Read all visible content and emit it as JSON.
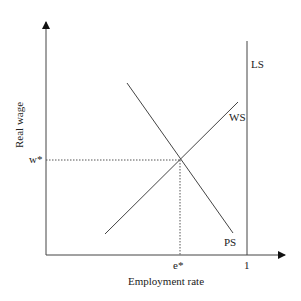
{
  "diagram": {
    "type": "economics-wage-setting-price-setting",
    "axes": {
      "x_label": "Employment rate",
      "y_label": "Real wage",
      "x_tick_equilibrium": "e*",
      "x_tick_full": "1",
      "y_tick_equilibrium": "w*"
    },
    "curves": {
      "ls": "LS",
      "ws": "WS",
      "ps": "PS"
    },
    "colors": {
      "line": "#444444",
      "text": "#222222",
      "background": "#ffffff"
    }
  }
}
